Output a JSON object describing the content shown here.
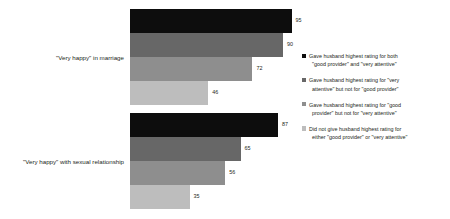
{
  "chart_data": {
    "type": "bar",
    "orientation": "horizontal",
    "title": "",
    "xlabel": "",
    "ylabel": "",
    "xlim": [
      0,
      100
    ],
    "grid": false,
    "legend_position": "right",
    "categories": [
      "\"Very happy\" in marriage",
      "\"Very happy\" with sexual relationship"
    ],
    "series": [
      {
        "name": "Gave husband highest rating for both \"good provider\" and \"very attentive\"",
        "color": "#0d0d0d",
        "values": [
          95,
          87
        ]
      },
      {
        "name": "Gave husband highest rating for \"very attentive\" but not for \"good provider\"",
        "color": "#676767",
        "values": [
          90,
          65
        ]
      },
      {
        "name": "Gave husband highest rating for \"good provider\" but not for \"very attentive\"",
        "color": "#8e8e8e",
        "values": [
          72,
          56
        ]
      },
      {
        "name": "Did not give husband highest rating for either \"good provider\" or \"very attentive\"",
        "color": "#bdbdbd",
        "values": [
          46,
          35
        ]
      }
    ]
  },
  "groups": [
    {
      "label": "\"Very happy\" in marriage",
      "bars": [
        {
          "value": "95",
          "pct": 95,
          "color": "#0d0d0d"
        },
        {
          "value": "90",
          "pct": 90,
          "color": "#676767"
        },
        {
          "value": "72",
          "pct": 72,
          "color": "#8e8e8e"
        },
        {
          "value": "46",
          "pct": 46,
          "color": "#bdbdbd"
        }
      ]
    },
    {
      "label": "\"Very happy\" with sexual relationship",
      "bars": [
        {
          "value": "87",
          "pct": 87,
          "color": "#0d0d0d"
        },
        {
          "value": "65",
          "pct": 65,
          "color": "#676767"
        },
        {
          "value": "56",
          "pct": 56,
          "color": "#8e8e8e"
        },
        {
          "value": "35",
          "pct": 35,
          "color": "#bdbdbd"
        }
      ]
    }
  ],
  "legend": {
    "items": [
      {
        "color": "#0d0d0d",
        "line1": "Gave husband highest rating for both",
        "line2": "\"good provider\" and \"very attentive\""
      },
      {
        "color": "#676767",
        "line1": "Gave husband highest rating for \"very",
        "line2": "attentive\" but not for \"good provider\""
      },
      {
        "color": "#8e8e8e",
        "line1": "Gave husband highest rating for \"good",
        "line2": "provider\" but not for \"very attentive\""
      },
      {
        "color": "#bdbdbd",
        "line1": "Did not give husband highest rating for",
        "line2": "either \"good provider\" or \"very attentive\""
      }
    ]
  }
}
